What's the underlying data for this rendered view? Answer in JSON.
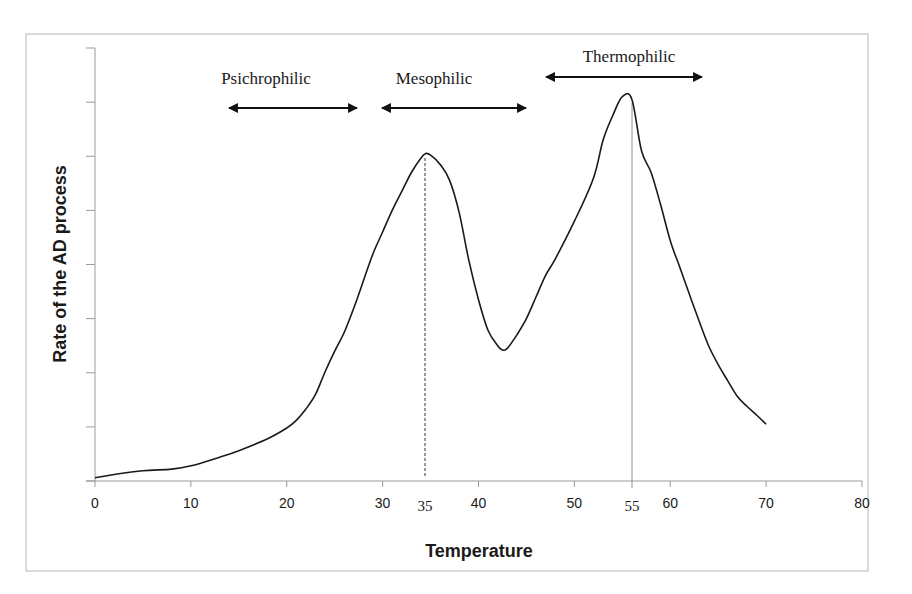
{
  "chart_data": {
    "type": "line",
    "title": "",
    "xlabel": "Temperature",
    "ylabel": "Rate of the AD process",
    "xlim": [
      0,
      80
    ],
    "ylim": [
      0,
      8
    ],
    "x_ticks": [
      0,
      10,
      20,
      30,
      40,
      50,
      60,
      70,
      80
    ],
    "y_ticks_count": 9,
    "y_tick_labels_shown": false,
    "grid": false,
    "legend": null,
    "series": [
      {
        "name": "Rate of the AD process",
        "x": [
          0,
          2,
          5,
          8,
          10,
          13,
          15,
          18,
          20,
          21,
          22,
          23,
          24,
          25,
          26,
          27,
          28,
          29,
          30,
          31,
          32,
          33,
          34,
          34.5,
          35,
          36,
          37,
          38,
          39,
          40,
          41,
          42,
          42.5,
          43,
          44,
          45,
          46,
          47,
          48,
          50,
          52,
          53,
          54,
          55,
          56,
          57,
          58,
          59,
          60,
          61,
          62,
          63,
          64,
          65,
          66,
          67,
          68,
          69,
          70
        ],
        "values": [
          0.06,
          0.12,
          0.19,
          0.22,
          0.28,
          0.44,
          0.56,
          0.78,
          0.98,
          1.12,
          1.33,
          1.6,
          2.02,
          2.4,
          2.75,
          3.2,
          3.7,
          4.2,
          4.6,
          5.0,
          5.35,
          5.7,
          5.97,
          6.05,
          6.02,
          5.85,
          5.55,
          4.95,
          4.07,
          3.35,
          2.78,
          2.5,
          2.42,
          2.45,
          2.7,
          3.0,
          3.4,
          3.8,
          4.1,
          4.8,
          5.6,
          6.3,
          6.75,
          7.1,
          7.05,
          6.1,
          5.7,
          5.1,
          4.44,
          3.95,
          3.45,
          2.96,
          2.5,
          2.15,
          1.85,
          1.56,
          1.38,
          1.22,
          1.05
        ]
      }
    ],
    "reference_lines": [
      {
        "x": 35,
        "label": "35",
        "style": "dashed"
      },
      {
        "x": 55,
        "label": "55",
        "style": "solid-thin"
      }
    ],
    "annotations": [
      {
        "text": "Psichrophilic",
        "type": "double-arrow",
        "x_start": 14,
        "x_end": 27.5
      },
      {
        "text": "Mesophilic",
        "type": "double-arrow",
        "x_start": 30,
        "x_end": 45
      },
      {
        "text": "Thermophilic",
        "type": "double-arrow",
        "x_start": 47,
        "x_end": 63.5
      }
    ]
  },
  "labels": {
    "x_axis_title": "Temperature",
    "y_axis_title": "Rate of the AD process",
    "x_ticks": [
      "0",
      "10",
      "20",
      "30",
      "40",
      "50",
      "60",
      "70",
      "80"
    ],
    "marker_35": "35",
    "marker_55": "55",
    "region_psichrophilic": "Psichrophilic",
    "region_mesophilic": "Mesophilic",
    "region_thermophilic": "Thermophilic"
  },
  "colors": {
    "line": "#1a1a1a",
    "axis": "#9a9a9a",
    "frame": "#b5b5b5",
    "background": "#ffffff"
  }
}
